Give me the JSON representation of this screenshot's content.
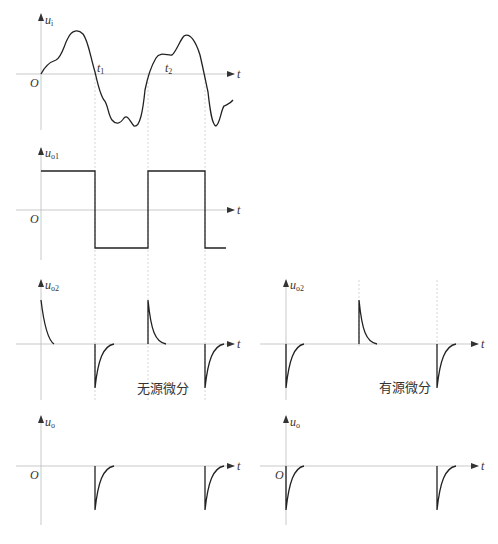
{
  "figure": {
    "plots": [
      {
        "id": "ui",
        "ylabel": "u",
        "ysub": "i",
        "origin": "O",
        "xlabel": "t",
        "markers": [
          {
            "label": "t",
            "sub": "1"
          },
          {
            "label": "t",
            "sub": "2"
          }
        ]
      },
      {
        "id": "uo1",
        "ylabel": "u",
        "ysub": "o1",
        "origin": "O",
        "xlabel": "t"
      },
      {
        "id": "uo2_passive",
        "ylabel": "u",
        "ysub": "o2",
        "xlabel": "t",
        "caption": "无源微分"
      },
      {
        "id": "uo2_active",
        "ylabel": "u",
        "ysub": "o2",
        "xlabel": "t",
        "caption": "有源微分"
      },
      {
        "id": "uo_left",
        "ylabel": "u",
        "ysub": "o",
        "origin": "O",
        "xlabel": "t"
      },
      {
        "id": "uo_right",
        "ylabel": "u",
        "ysub": "o",
        "origin": "O",
        "xlabel": "t"
      }
    ],
    "colors": {
      "curve": "#222222",
      "axis": "#bbbbbb",
      "guide": "#cccccc"
    }
  }
}
